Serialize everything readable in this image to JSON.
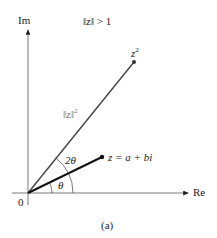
{
  "figure": {
    "axes": {
      "real_label": "Re",
      "imag_label": "Im",
      "origin_label": "0"
    },
    "condition": "‖z‖ > 1",
    "points": {
      "z_label": "z = a + bi",
      "z2_label": "z",
      "z2_sup": "2"
    },
    "modulus_label": "‖z‖",
    "modulus_sup": "2",
    "angles": {
      "theta": "θ",
      "two_theta": "2θ"
    },
    "caption": "(a)"
  }
}
